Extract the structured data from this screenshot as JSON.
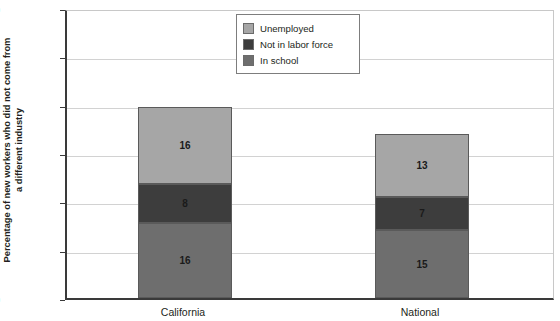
{
  "chart_data": {
    "type": "bar",
    "subtype": "stacked-vertical",
    "title": "",
    "xlabel": "",
    "ylabel": "Percentage of new workers who did not come from\na different industry",
    "categories": [
      "California",
      "National"
    ],
    "ylim": [
      0,
      60
    ],
    "yticks": [
      0,
      10,
      20,
      30,
      40,
      50,
      60
    ],
    "ytick_labels": [
      "0",
      "10",
      "20",
      "30",
      "40",
      "50",
      "60"
    ],
    "grid": true,
    "legend_position": "top-center",
    "stack_order_bottom_to_top": [
      "In school",
      "Not in labor force",
      "Unemployed"
    ],
    "series": [
      {
        "name": "Unemployed",
        "color": "#a6a6a6",
        "values": [
          16,
          13
        ],
        "labels": [
          "16",
          "13"
        ]
      },
      {
        "name": "Not in labor force",
        "color": "#3d3d3d",
        "values": [
          8,
          7
        ],
        "labels": [
          "8",
          "7"
        ]
      },
      {
        "name": "In school",
        "color": "#6e6e6e",
        "values": [
          15.5,
          14
        ],
        "labels": [
          "16",
          "15"
        ]
      }
    ],
    "totals": [
      39.5,
      34.5
    ]
  },
  "legend": {
    "items": [
      {
        "label": "Unemployed",
        "color": "#a6a6a6"
      },
      {
        "label": "Not in labor force",
        "color": "#3d3d3d"
      },
      {
        "label": "In school",
        "color": "#6e6e6e"
      }
    ]
  },
  "axis": {
    "y_title": "Percentage of new workers who did not come from\na different industry"
  }
}
